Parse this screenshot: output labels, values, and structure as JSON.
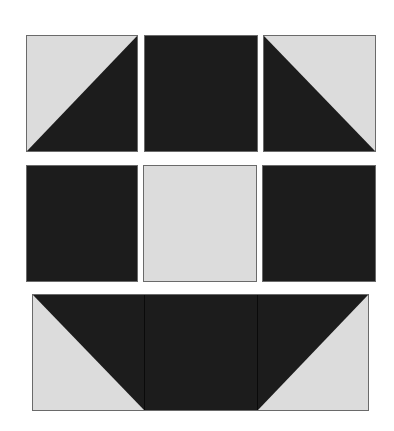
{
  "colors": {
    "light": "#dcdcdc",
    "dark": "#1c1c1c",
    "border": "#6a6a6a",
    "background": "#ffffff"
  },
  "quilt": {
    "rows": [
      {
        "name": "top-row",
        "blocks": [
          {
            "type": "half-square-triangle",
            "light": "top-left",
            "dark": "bottom-right"
          },
          {
            "type": "solid",
            "fill": "dark"
          },
          {
            "type": "half-square-triangle",
            "light": "top-right",
            "dark": "bottom-left"
          }
        ]
      },
      {
        "name": "middle-row",
        "blocks": [
          {
            "type": "solid",
            "fill": "dark"
          },
          {
            "type": "solid",
            "fill": "light"
          },
          {
            "type": "solid",
            "fill": "dark"
          }
        ]
      },
      {
        "name": "bottom-row",
        "joined": true,
        "blocks": [
          {
            "type": "half-square-triangle",
            "light": "bottom-left",
            "dark": "top-right"
          },
          {
            "type": "solid",
            "fill": "dark"
          },
          {
            "type": "half-square-triangle",
            "light": "bottom-right",
            "dark": "top-left"
          }
        ]
      }
    ]
  }
}
